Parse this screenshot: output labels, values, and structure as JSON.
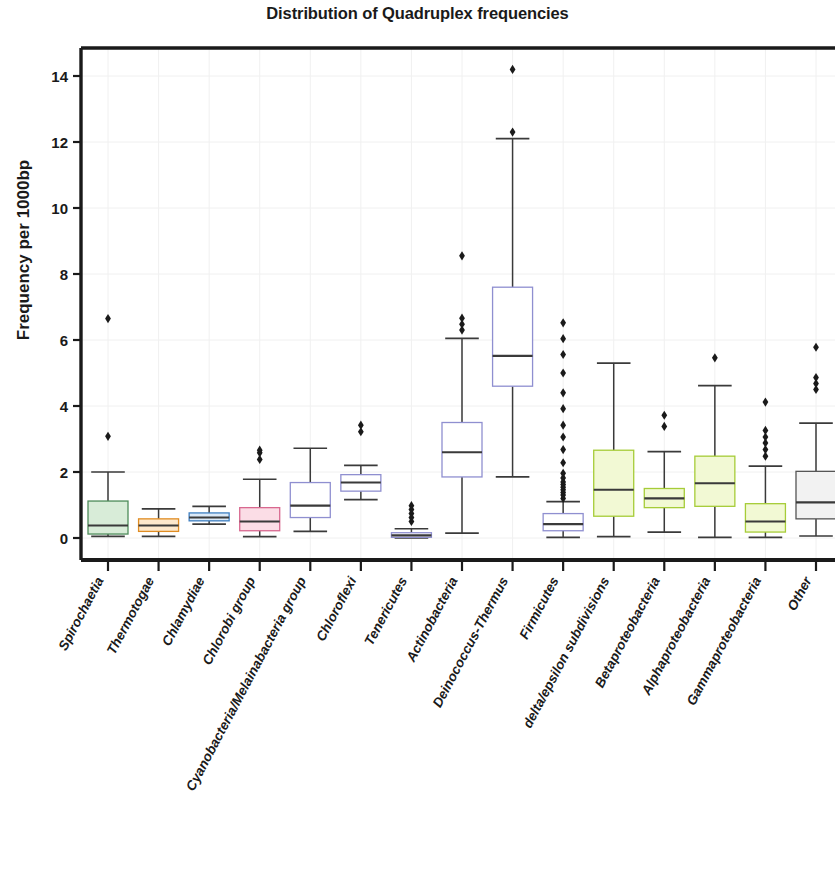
{
  "chart_data": {
    "type": "box",
    "title": "Distribution of Quadruplex frequencies",
    "xlabel": "",
    "ylabel": "Frequency per 1000bp",
    "ylim": [
      -0.55,
      15.2
    ],
    "yticks": [
      0,
      2,
      4,
      6,
      8,
      10,
      12,
      14
    ],
    "ytick_labels": [
      "0",
      "2",
      "4",
      "6",
      "8",
      "10",
      "12",
      "14"
    ],
    "grid": true,
    "legend": "none",
    "categories": [
      "Spirochaetia",
      "Thermotogae",
      "Chlamydiae",
      "Chlorobi group",
      "Cyanobacteria/Melainabacteria group",
      "Chloroflexi",
      "Tenericutes",
      "Actinobacteria",
      "Deinococcus-Thermus",
      "Firmicutes",
      "delta/epsilon subdivisions",
      "Betaproteobacteria",
      "Alphaproteobacteria",
      "Gammaproteobacteria",
      "Other"
    ],
    "boxes": [
      {
        "label": "Spirochaetia",
        "color": "#d8ecd8",
        "edge": "#4e8c5a",
        "whisker_low": 0.05,
        "q1": 0.12,
        "median": 0.38,
        "q3": 1.12,
        "whisker_high": 2.0,
        "fliers": [
          3.08,
          6.65
        ]
      },
      {
        "label": "Thermotogae",
        "color": "#fde8cc",
        "edge": "#e08c22",
        "whisker_low": 0.05,
        "q1": 0.2,
        "median": 0.38,
        "q3": 0.58,
        "whisker_high": 0.88,
        "fliers": []
      },
      {
        "label": "Chlamydiae",
        "color": "#dbe9f7",
        "edge": "#3f7fc1",
        "whisker_low": 0.42,
        "q1": 0.52,
        "median": 0.62,
        "q3": 0.76,
        "whisker_high": 0.96,
        "fliers": []
      },
      {
        "label": "Chlorobi group",
        "color": "#fbdde6",
        "edge": "#d8688f",
        "whisker_low": 0.04,
        "q1": 0.22,
        "median": 0.5,
        "q3": 0.92,
        "whisker_high": 1.78,
        "fliers": [
          2.38,
          2.58,
          2.66
        ]
      },
      {
        "label": "Cyanobacteria/Melainabacteria group",
        "color": "#ffffff",
        "edge": "#8f8fd0",
        "whisker_low": 0.2,
        "q1": 0.62,
        "median": 0.98,
        "q3": 1.68,
        "whisker_high": 2.72,
        "fliers": []
      },
      {
        "label": "Chloroflexi",
        "color": "#ffffff",
        "edge": "#8f8fd0",
        "whisker_low": 1.16,
        "q1": 1.42,
        "median": 1.68,
        "q3": 1.92,
        "whisker_high": 2.2,
        "fliers": [
          3.22,
          3.42
        ]
      },
      {
        "label": "Tenericutes",
        "color": "#ffffff",
        "edge": "#8f8fd0",
        "whisker_low": 0.0,
        "q1": 0.02,
        "median": 0.08,
        "q3": 0.16,
        "whisker_high": 0.28,
        "fliers": [
          0.5,
          0.62,
          0.74,
          0.86,
          0.98
        ]
      },
      {
        "label": "Actinobacteria",
        "color": "#ffffff",
        "edge": "#8f8fd0",
        "whisker_low": 0.15,
        "q1": 1.85,
        "median": 2.6,
        "q3": 3.5,
        "whisker_high": 6.05,
        "fliers": [
          6.3,
          6.48,
          6.66,
          8.55
        ]
      },
      {
        "label": "Deinococcus-Thermus",
        "color": "#ffffff",
        "edge": "#8f8fd0",
        "whisker_low": 1.85,
        "q1": 4.6,
        "median": 5.52,
        "q3": 7.6,
        "whisker_high": 12.1,
        "fliers": [
          12.3,
          14.2
        ]
      },
      {
        "label": "Firmicutes",
        "color": "#ffffff",
        "edge": "#8f8fd0",
        "whisker_low": 0.02,
        "q1": 0.22,
        "median": 0.42,
        "q3": 0.74,
        "whisker_high": 1.1,
        "fliers": [
          1.2,
          1.3,
          1.38,
          1.46,
          1.54,
          1.62,
          1.7,
          1.82,
          1.96,
          2.28,
          2.68,
          3.06,
          3.42,
          3.92,
          4.4,
          5.0,
          5.56,
          6.04,
          6.52
        ]
      },
      {
        "label": "delta/epsilon subdivisions",
        "color": "#f2f9d4",
        "edge": "#a6cc38",
        "whisker_low": 0.04,
        "q1": 0.66,
        "median": 1.46,
        "q3": 2.66,
        "whisker_high": 5.3,
        "fliers": []
      },
      {
        "label": "Betaproteobacteria",
        "color": "#f2f9d4",
        "edge": "#a6cc38",
        "whisker_low": 0.18,
        "q1": 0.92,
        "median": 1.2,
        "q3": 1.5,
        "whisker_high": 2.62,
        "fliers": [
          3.38,
          3.72
        ]
      },
      {
        "label": "Alphaproteobacteria",
        "color": "#f2f9d4",
        "edge": "#a6cc38",
        "whisker_low": 0.02,
        "q1": 0.96,
        "median": 1.66,
        "q3": 2.48,
        "whisker_high": 4.62,
        "fliers": [
          5.46
        ]
      },
      {
        "label": "Gammaproteobacteria",
        "color": "#f2f9d4",
        "edge": "#a6cc38",
        "whisker_low": 0.02,
        "q1": 0.18,
        "median": 0.5,
        "q3": 1.04,
        "whisker_high": 2.18,
        "fliers": [
          2.48,
          2.68,
          2.88,
          3.06,
          3.26,
          4.12
        ]
      },
      {
        "label": "Other",
        "color": "#f2f2f2",
        "edge": "#555555",
        "whisker_low": 0.06,
        "q1": 0.58,
        "median": 1.08,
        "q3": 2.02,
        "whisker_high": 3.48,
        "fliers": [
          4.5,
          4.68,
          4.86,
          5.78
        ]
      }
    ]
  }
}
